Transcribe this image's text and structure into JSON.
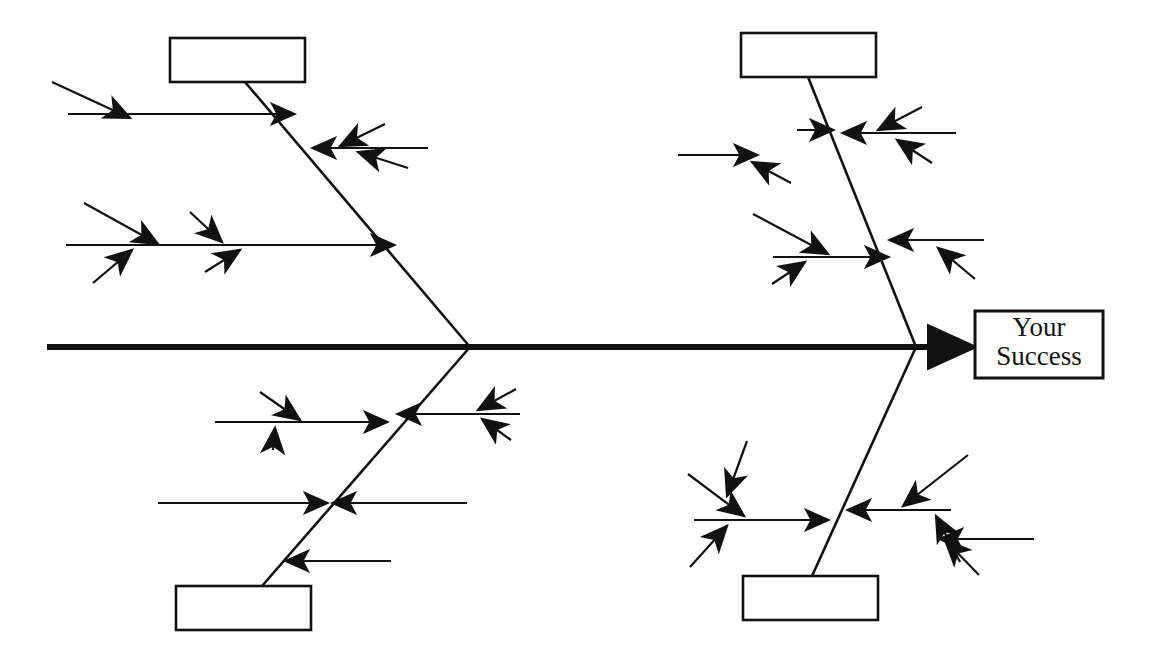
{
  "diagram": {
    "type": "fishbone",
    "alt_name": "Ishikawa cause-and-effect diagram",
    "canvas": {
      "width": 1155,
      "height": 660
    },
    "colors": {
      "stroke": "#111111",
      "background": "#ffffff",
      "box_fill": "#ffffff"
    },
    "effect": {
      "label_line1": "Your",
      "label_line2": "Success",
      "box": {
        "x": 975,
        "y": 311,
        "width": 128,
        "height": 67
      }
    },
    "spine": {
      "name": "main-spine",
      "x1": 47,
      "y1": 347,
      "x2": 972,
      "y2": 347,
      "stroke_width": 6,
      "arrow": "right"
    },
    "categories": [
      {
        "id": "top-left",
        "label": "",
        "box": {
          "x": 170,
          "y": 38,
          "width": 135,
          "height": 44
        },
        "spine": {
          "x1": 245,
          "y1": 82,
          "x2": 470,
          "y2": 347
        },
        "bone_count": 3
      },
      {
        "id": "top-right",
        "label": "",
        "box": {
          "x": 741,
          "y": 33,
          "width": 135,
          "height": 44
        },
        "spine": {
          "x1": 808,
          "y1": 77,
          "x2": 916,
          "y2": 347
        },
        "bone_count": 4
      },
      {
        "id": "bottom-left",
        "label": "",
        "box": {
          "x": 176,
          "y": 586,
          "width": 135,
          "height": 44
        },
        "spine": {
          "x1": 262,
          "y1": 586,
          "x2": 470,
          "y2": 347
        },
        "bone_count": 5
      },
      {
        "id": "bottom-right",
        "label": "",
        "box": {
          "x": 743,
          "y": 576,
          "width": 135,
          "height": 44
        },
        "spine": {
          "x1": 812,
          "y1": 576,
          "x2": 916,
          "y2": 347
        },
        "bone_count": 4
      }
    ],
    "bones": [
      {
        "id": "tl-b1",
        "category": "top-left",
        "label": "",
        "dir": "right",
        "x1": 68,
        "y1": 114,
        "x2": 294,
        "y2": 114
      },
      {
        "id": "tl-b2",
        "category": "top-left",
        "label": "",
        "dir": "left",
        "x1": 428,
        "y1": 148,
        "x2": 313,
        "y2": 148
      },
      {
        "id": "tl-b3",
        "category": "top-left",
        "label": "",
        "dir": "right",
        "x1": 66,
        "y1": 245,
        "x2": 394,
        "y2": 245
      },
      {
        "id": "tr-b1",
        "category": "top-right",
        "label": "",
        "dir": "right",
        "x1": 678,
        "y1": 155,
        "x2": 757,
        "y2": 155
      },
      {
        "id": "tr-b2",
        "category": "top-right",
        "label": "",
        "dir": "right",
        "x1": 797,
        "y1": 130,
        "x2": 833,
        "y2": 130
      },
      {
        "id": "tr-b3",
        "category": "top-right",
        "label": "",
        "dir": "left",
        "x1": 956,
        "y1": 133,
        "x2": 843,
        "y2": 133
      },
      {
        "id": "tr-b4",
        "category": "top-right",
        "label": "",
        "dir": "right",
        "x1": 773,
        "y1": 257,
        "x2": 888,
        "y2": 257
      },
      {
        "id": "tr-b5",
        "category": "top-right",
        "label": "",
        "dir": "left",
        "x1": 984,
        "y1": 240,
        "x2": 890,
        "y2": 240
      },
      {
        "id": "bl-b1",
        "category": "bottom-left",
        "label": "",
        "dir": "right",
        "x1": 215,
        "y1": 422,
        "x2": 387,
        "y2": 422
      },
      {
        "id": "bl-b2",
        "category": "bottom-left",
        "label": "",
        "dir": "left",
        "x1": 520,
        "y1": 414,
        "x2": 398,
        "y2": 414
      },
      {
        "id": "bl-b3",
        "category": "bottom-left",
        "label": "",
        "dir": "right",
        "x1": 158,
        "y1": 503,
        "x2": 327,
        "y2": 503
      },
      {
        "id": "bl-b4",
        "category": "bottom-left",
        "label": "",
        "dir": "left",
        "x1": 467,
        "y1": 503,
        "x2": 333,
        "y2": 503
      },
      {
        "id": "bl-b5",
        "category": "bottom-left",
        "label": "",
        "dir": "left",
        "x1": 391,
        "y1": 561,
        "x2": 286,
        "y2": 561
      },
      {
        "id": "br-b1",
        "category": "bottom-right",
        "label": "",
        "dir": "right",
        "x1": 694,
        "y1": 520,
        "x2": 828,
        "y2": 520
      },
      {
        "id": "br-b2",
        "category": "bottom-right",
        "label": "",
        "dir": "left",
        "x1": 951,
        "y1": 510,
        "x2": 848,
        "y2": 510
      },
      {
        "id": "br-b3",
        "category": "bottom-right",
        "label": "",
        "dir": "left",
        "x1": 1034,
        "y1": 539,
        "x2": 940,
        "y2": 539
      }
    ],
    "sub_causes": [
      {
        "id": "tl-s1",
        "label": "",
        "x1": 52,
        "y1": 82,
        "x2": 130,
        "y2": 118
      },
      {
        "id": "tl-s2",
        "label": "",
        "x1": 385,
        "y1": 124,
        "x2": 340,
        "y2": 146
      },
      {
        "id": "tl-s3",
        "label": "",
        "x1": 408,
        "y1": 168,
        "x2": 358,
        "y2": 152
      },
      {
        "id": "tl-s4",
        "label": "",
        "x1": 84,
        "y1": 203,
        "x2": 158,
        "y2": 244
      },
      {
        "id": "tl-s5",
        "label": "",
        "x1": 93,
        "y1": 283,
        "x2": 132,
        "y2": 250
      },
      {
        "id": "tl-s6",
        "label": "",
        "x1": 190,
        "y1": 212,
        "x2": 222,
        "y2": 242
      },
      {
        "id": "tl-s7",
        "label": "",
        "x1": 205,
        "y1": 272,
        "x2": 240,
        "y2": 250
      },
      {
        "id": "tr-s1",
        "label": "",
        "x1": 791,
        "y1": 183,
        "x2": 752,
        "y2": 162
      },
      {
        "id": "tr-s2",
        "label": "",
        "x1": 922,
        "y1": 107,
        "x2": 878,
        "y2": 130
      },
      {
        "id": "tr-s3",
        "label": "",
        "x1": 932,
        "y1": 163,
        "x2": 897,
        "y2": 140
      },
      {
        "id": "tr-s4",
        "label": "",
        "x1": 753,
        "y1": 214,
        "x2": 828,
        "y2": 254
      },
      {
        "id": "tr-s5",
        "label": "",
        "x1": 772,
        "y1": 284,
        "x2": 805,
        "y2": 262
      },
      {
        "id": "tr-s6",
        "label": "",
        "x1": 975,
        "y1": 279,
        "x2": 938,
        "y2": 248
      },
      {
        "id": "bl-s1",
        "label": "",
        "x1": 260,
        "y1": 392,
        "x2": 300,
        "y2": 420
      },
      {
        "id": "bl-s2",
        "label": "",
        "x1": 273,
        "y1": 450,
        "x2": 275,
        "y2": 428
      },
      {
        "id": "bl-s3",
        "label": "",
        "x1": 516,
        "y1": 389,
        "x2": 478,
        "y2": 410
      },
      {
        "id": "bl-s4",
        "label": "",
        "x1": 511,
        "y1": 440,
        "x2": 482,
        "y2": 419
      },
      {
        "id": "br-s1",
        "label": "",
        "x1": 747,
        "y1": 441,
        "x2": 727,
        "y2": 496
      },
      {
        "id": "br-s2",
        "label": "",
        "x1": 688,
        "y1": 474,
        "x2": 744,
        "y2": 516
      },
      {
        "id": "br-s3",
        "label": "",
        "x1": 690,
        "y1": 567,
        "x2": 727,
        "y2": 526
      },
      {
        "id": "br-s4",
        "label": "",
        "x1": 968,
        "y1": 455,
        "x2": 903,
        "y2": 506
      },
      {
        "id": "br-s5",
        "label": "",
        "x1": 960,
        "y1": 562,
        "x2": 936,
        "y2": 516
      },
      {
        "id": "br-s6",
        "label": "",
        "x1": 979,
        "y1": 575,
        "x2": 945,
        "y2": 540
      }
    ]
  }
}
